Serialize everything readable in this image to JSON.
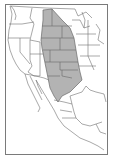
{
  "map": {
    "type": "range-map",
    "region": "Western North America (United States and Mexico)",
    "colors": {
      "background": "#ffffff",
      "frame": "#7a7a7a",
      "borders": "#6e6e6e",
      "range_fill": "#b3b3b3",
      "range_stroke": "#6a6a6a"
    },
    "highlighted_range": "Great Plains (Montana/North Dakota south to Texas and northern Mexico)"
  }
}
